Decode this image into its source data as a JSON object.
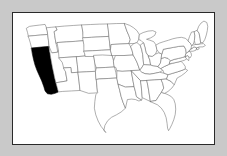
{
  "figure": {
    "background_color": "#c9c9c9",
    "map_background_color": "#ffffff",
    "frame_color": "#2a2a2a",
    "state_border_color": "#6d6d6d",
    "highlight_color": "#000000",
    "projection_note": "continental US, state boundaries"
  },
  "map_data": {
    "type": "choropleth",
    "region": "United States (lower 48)",
    "highlighted_states": [
      "California"
    ],
    "legend": [],
    "labels": [],
    "states": [
      {
        "name": "Washington",
        "highlighted": false,
        "path": "M17.5,9.5 L21.0,9.0 L27.5,8.2 L33.5,7.5 L35.0,11.0 L35.8,14.5 L36.2,18.0 L29.0,18.6 L22.0,19.2 L16.0,19.8 L15.2,16.0 L14.0,12.0 Z"
      },
      {
        "name": "Oregon",
        "highlighted": false,
        "path": "M16.0,19.8 L22.0,19.2 L29.0,18.6 L36.2,18.0 L37.0,24.0 L37.6,30.5 L30.0,31.2 L23.0,31.8 L19.4,32.2 L18.0,26.5 L16.8,22.5 Z"
      },
      {
        "name": "California",
        "highlighted": true,
        "path": "M19.4,32.2 L23.0,31.8 L30.0,31.2 L37.6,30.5 L38.4,36.0 L39.2,41.5 L40.2,47.0 L41.2,52.5 L42.4,58.0 L43.4,63.0 L44.8,68.5 L46.2,73.5 L47.4,78.0 L44.0,79.5 L40.0,80.5 L36.0,80.0 L33.5,77.0 L32.0,72.0 L30.0,66.5 L27.5,61.0 L25.0,55.5 L23.0,50.0 L21.5,44.5 L20.2,38.5 Z"
      },
      {
        "name": "Idaho",
        "highlighted": false,
        "path": "M35.0,11.0 L40.0,10.5 L45.0,10.0 L45.8,13.5 L43.0,15.0 L43.6,19.0 L44.2,23.0 L45.0,27.5 L46.0,32.0 L46.8,36.5 L41.0,37.2 L38.4,36.0 L37.6,30.5 L37.0,24.0 L36.2,18.0 L35.8,14.5 Z"
      },
      {
        "name": "Nevada",
        "highlighted": false,
        "path": "M37.6,30.5 L38.4,36.0 L39.2,41.5 L40.2,47.0 L41.2,52.5 L42.4,58.0 L43.4,63.0 L44.8,68.5 L56.5,66.5 L55.0,57.5 L53.5,48.0 L52.0,38.5 L50.5,29.5 L46.8,36.5 L41.0,37.2 Z"
      },
      {
        "name": "Montana",
        "highlighted": false,
        "path": "M45.0,10.0 L54.0,9.2 L63.0,8.6 L72.0,8.0 L73.0,16.0 L74.0,24.5 L65.0,25.2 L56.0,25.8 L46.4,26.4 L45.0,27.5 L44.2,23.0 L43.6,19.0 L43.0,15.0 L45.8,13.5 Z"
      },
      {
        "name": "Wyoming",
        "highlighted": false,
        "path": "M46.4,26.4 L56.0,25.8 L65.0,25.2 L74.0,24.5 L74.8,32.5 L75.5,40.5 L66.5,41.2 L57.5,41.8 L48.0,42.4 L47.4,34.5 Z"
      },
      {
        "name": "Utah",
        "highlighted": false,
        "path": "M48.0,42.4 L57.5,41.8 L66.5,41.2 L67.2,49.5 L68.0,57.5 L61.0,58.0 L60.4,52.5 L53.0,53.0 L51.5,47.5 Z"
      },
      {
        "name": "Colorado",
        "highlighted": false,
        "path": "M66.5,41.2 L75.5,40.5 L84.5,39.8 L85.5,48.0 L86.2,56.5 L77.0,57.0 L68.0,57.5 L67.2,49.5 Z"
      },
      {
        "name": "Arizona",
        "highlighted": false,
        "path": "M53.0,53.0 L60.4,52.5 L61.0,58.0 L68.0,57.5 L69.0,67.0 L70.0,76.5 L61.0,77.0 L52.0,77.5 L47.4,78.0 L46.2,73.5 L44.8,68.5 L56.5,66.5 L55.0,57.5 Z"
      },
      {
        "name": "New Mexico",
        "highlighted": false,
        "path": "M68.0,57.5 L77.0,57.0 L86.2,56.5 L87.0,65.0 L87.8,73.5 L88.2,79.0 L79.0,79.5 L70.0,76.5 L69.0,67.0 Z"
      },
      {
        "name": "North Dakota",
        "highlighted": false,
        "path": "M72.0,8.0 L81.0,7.6 L90.0,7.2 L99.0,7.0 L99.6,13.5 L100.2,20.0 L91.0,20.5 L82.0,21.0 L73.0,21.5 L73.0,16.0 Z"
      },
      {
        "name": "South Dakota",
        "highlighted": false,
        "path": "M73.0,21.5 L82.0,21.0 L91.0,20.5 L100.2,20.0 L101.0,27.0 L101.8,34.0 L92.5,34.5 L83.0,35.0 L74.0,35.5 L74.0,29.0 Z"
      },
      {
        "name": "Nebraska",
        "highlighted": false,
        "path": "M74.0,35.5 L83.0,35.0 L92.5,34.5 L101.8,34.0 L103.5,40.0 L105.0,45.5 L95.5,46.0 L86.0,46.5 L84.8,41.0 L75.5,41.0 L74.8,38.0 Z"
      },
      {
        "name": "Kansas",
        "highlighted": false,
        "path": "M84.5,39.8 L93.5,39.4 L103.5,40.0 L105.0,45.5 L106.0,52.0 L96.5,52.5 L87.0,53.0 L85.5,48.0 Z"
      },
      {
        "name": "Oklahoma",
        "highlighted": false,
        "path": "M86.2,56.5 L87.0,53.0 L96.5,52.5 L106.0,52.0 L107.5,58.0 L108.5,63.5 L99.5,64.0 L90.0,64.5 L87.0,65.0 Z"
      },
      {
        "name": "Texas",
        "highlighted": false,
        "path": "M87.8,73.5 L87.0,65.0 L90.0,64.5 L99.5,64.0 L108.5,63.5 L110.0,70.0 L111.5,76.5 L113.0,83.0 L115.0,89.0 L117.5,95.0 L113.0,99.0 L108.0,102.0 L103.0,104.5 L99.0,108.0 L96.0,113.0 L95.0,118.0 L97.0,120.5 L95.5,118.5 L92.0,114.0 L89.0,108.5 L86.5,102.0 L85.0,95.0 L85.5,88.0 L86.5,81.0 L88.2,79.0 Z"
      },
      {
        "name": "Minnesota",
        "highlighted": false,
        "path": "M99.0,7.0 L108.0,6.6 L116.5,6.5 L117.5,10.0 L119.0,14.5 L121.0,19.0 L122.5,23.5 L121.0,27.5 L112.0,28.0 L102.5,28.5 L101.8,34.0 L101.0,27.0 L100.2,20.0 L99.6,13.5 Z"
      },
      {
        "name": "Iowa",
        "highlighted": false,
        "path": "M101.8,34.0 L102.5,28.5 L112.0,28.0 L121.0,27.5 L123.0,31.0 L124.5,35.0 L125.5,39.5 L116.0,40.0 L107.0,40.0 L103.5,40.0 Z"
      },
      {
        "name": "Missouri",
        "highlighted": false,
        "path": "M105.0,45.5 L107.0,40.0 L116.0,40.0 L125.5,39.5 L127.5,43.0 L129.5,47.0 L131.0,51.0 L132.5,55.5 L123.5,56.0 L114.0,56.5 L108.5,56.0 L107.5,52.5 L106.0,52.0 Z"
      },
      {
        "name": "Arkansas",
        "highlighted": false,
        "path": "M108.5,63.5 L108.5,56.0 L114.0,56.5 L123.5,56.0 L124.5,61.5 L125.5,67.0 L126.5,72.5 L117.5,73.0 L110.0,70.0 Z"
      },
      {
        "name": "Louisiana",
        "highlighted": false,
        "path": "M110.0,70.0 L117.5,73.0 L126.5,72.5 L128.0,78.0 L129.0,83.0 L132.0,85.0 L134.5,86.5 L131.5,87.5 L128.0,86.0 L124.0,85.5 L119.5,86.0 L117.5,95.0 L115.0,89.0 L113.0,83.0 L111.5,76.5 Z"
      },
      {
        "name": "Wisconsin",
        "highlighted": false,
        "path": "M116.5,6.5 L122.0,8.5 L126.0,11.0 L129.5,14.0 L132.0,18.0 L131.5,23.0 L129.5,26.5 L126.5,27.5 L121.0,27.5 L122.5,23.5 L121.0,19.0 L119.0,14.5 L117.5,10.0 Z"
      },
      {
        "name": "Illinois",
        "highlighted": false,
        "path": "M126.5,27.5 L129.5,26.5 L133.0,29.5 L134.5,34.0 L135.5,39.0 L136.0,44.0 L136.5,49.5 L134.0,53.5 L132.5,55.5 L131.0,51.0 L129.5,47.0 L127.5,43.0 L125.5,39.5 L124.5,35.0 L123.0,31.0 Z"
      },
      {
        "name": "Michigan",
        "highlighted": false,
        "path": "M131.5,23.0 L132.0,18.0 L136.0,16.0 L141.0,14.5 L146.0,14.0 L149.5,15.5 L148.0,19.0 L144.0,21.5 L139.5,23.0 L143.0,24.0 L147.0,25.5 L149.5,29.0 L150.5,34.0 L149.0,38.5 L145.5,41.0 L141.5,40.5 L139.0,37.0 L138.0,32.0 L136.5,27.0 L134.0,24.5 Z"
      },
      {
        "name": "Indiana",
        "highlighted": false,
        "path": "M136.5,27.0 L138.0,32.0 L139.0,37.0 L141.5,40.5 L143.0,45.0 L143.8,50.0 L136.5,49.5 L136.0,44.0 L135.5,39.0 L134.5,34.0 L133.0,29.5 Z"
      },
      {
        "name": "Ohio",
        "highlighted": false,
        "path": "M141.5,40.5 L145.5,41.0 L149.0,38.5 L152.5,37.0 L155.5,38.5 L155.0,43.0 L154.0,48.0 L151.5,51.5 L147.0,51.0 L143.8,50.0 L143.0,45.0 Z"
      },
      {
        "name": "Kentucky",
        "highlighted": false,
        "path": "M134.0,53.5 L136.5,49.5 L143.8,50.0 L147.0,51.0 L151.5,51.5 L154.5,53.5 L156.5,55.5 L153.0,57.5 L148.5,58.5 L143.0,59.5 L138.0,59.0 L134.5,57.5 L132.5,55.5 Z"
      },
      {
        "name": "Tennessee",
        "highlighted": false,
        "path": "M132.5,55.5 L134.5,57.5 L138.0,59.0 L143.0,59.5 L148.5,58.5 L153.0,57.5 L158.0,58.5 L162.0,60.0 L160.5,64.5 L155.0,65.0 L148.0,65.5 L140.0,66.0 L133.5,66.5 L123.5,56.0 Z"
      },
      {
        "name": "Mississippi",
        "highlighted": false,
        "path": "M126.5,72.5 L125.5,67.0 L124.5,61.5 L123.5,56.0 L133.5,66.5 L134.0,72.0 L134.5,78.0 L135.0,84.0 L134.5,86.5 L132.0,85.0 L129.0,83.0 L128.0,78.0 Z"
      },
      {
        "name": "Alabama",
        "highlighted": false,
        "path": "M133.5,66.5 L140.0,66.0 L141.0,72.0 L142.0,78.0 L143.0,84.5 L143.5,88.0 L135.0,84.0 L134.5,78.0 L134.0,72.0 Z"
      },
      {
        "name": "Georgia",
        "highlighted": false,
        "path": "M140.0,66.0 L148.0,65.5 L155.0,65.0 L156.5,69.5 L157.5,74.0 L155.0,78.5 L152.0,83.0 L149.5,87.0 L143.5,88.0 L143.0,84.5 L142.0,78.0 L141.0,72.0 Z"
      },
      {
        "name": "Florida",
        "highlighted": false,
        "path": "M143.5,88.0 L149.5,87.0 L152.0,83.0 L155.0,78.5 L158.5,79.5 L162.0,81.0 L165.5,83.0 L168.0,86.0 L169.5,90.5 L170.0,96.0 L169.5,101.5 L168.0,107.0 L166.0,112.0 L164.0,116.0 L162.5,118.5 L161.5,116.0 L161.0,111.0 L160.0,105.0 L158.0,99.5 L155.0,95.0 L151.0,91.5 L146.5,89.5 Z"
      },
      {
        "name": "South Carolina",
        "highlighted": false,
        "path": "M155.0,65.0 L160.5,64.5 L165.0,67.0 L168.5,70.5 L166.0,74.0 L162.0,77.5 L158.5,79.5 L155.0,78.5 L157.5,74.0 L156.5,69.5 Z"
      },
      {
        "name": "North Carolina",
        "highlighted": false,
        "path": "M160.5,64.5 L162.0,60.0 L167.0,58.5 L172.0,57.0 L176.5,55.5 L180.0,54.0 L182.5,55.5 L180.0,58.0 L176.0,61.0 L171.5,63.5 L168.5,70.5 L165.0,67.0 Z"
      },
      {
        "name": "Virginia",
        "highlighted": false,
        "path": "M156.5,55.5 L154.5,53.5 L158.0,51.5 L162.5,49.5 L167.0,48.0 L171.5,47.0 L175.5,46.0 L178.0,48.5 L180.0,51.5 L180.0,54.0 L176.5,55.5 L172.0,57.0 L167.0,58.5 L162.0,60.0 L158.0,58.5 Z"
      },
      {
        "name": "West Virginia",
        "highlighted": false,
        "path": "M151.5,51.5 L154.0,48.0 L155.0,43.0 L158.5,42.0 L162.0,43.0 L164.5,45.5 L163.5,48.5 L162.5,49.5 L158.0,51.5 L154.5,53.5 Z"
      },
      {
        "name": "Maryland",
        "highlighted": false,
        "path": "M164.5,45.5 L168.5,44.0 L173.0,43.0 L177.0,42.0 L180.0,41.0 L181.5,43.5 L179.0,45.0 L175.5,46.0 L171.5,47.0 L167.0,48.0 L163.5,48.5 Z"
      },
      {
        "name": "Delaware",
        "highlighted": false,
        "path": "M180.0,41.0 L182.5,40.0 L184.0,42.5 L183.5,45.5 L181.5,43.5 Z"
      },
      {
        "name": "Pennsylvania",
        "highlighted": false,
        "path": "M155.5,38.5 L157.0,33.5 L162.0,32.5 L167.5,31.5 L173.0,30.5 L178.5,30.0 L180.5,33.5 L181.0,37.5 L180.0,41.0 L177.0,42.0 L173.0,43.0 L168.5,44.0 L164.5,45.5 L162.0,43.0 L158.5,42.0 L155.0,43.0 Z"
      },
      {
        "name": "New Jersey",
        "highlighted": false,
        "path": "M181.0,37.5 L184.0,35.5 L186.0,37.0 L186.5,40.0 L185.0,42.5 L182.5,40.0 L180.0,41.0 Z"
      },
      {
        "name": "New York",
        "highlighted": false,
        "path": "M149.5,29.0 L153.0,27.0 L157.5,25.5 L162.5,24.0 L167.0,22.5 L171.5,21.5 L176.0,21.0 L180.0,22.0 L183.0,24.5 L185.5,27.5 L188.0,30.5 L186.0,33.0 L184.0,35.5 L181.0,37.5 L180.5,33.5 L178.5,30.0 L173.0,30.5 L167.5,31.5 L162.0,32.5 L157.0,33.5 L155.5,38.5 L152.5,37.0 L150.5,34.0 Z"
      },
      {
        "name": "Connecticut",
        "highlighted": false,
        "path": "M186.0,33.0 L189.5,31.0 L192.0,32.0 L191.0,34.5 L188.0,35.5 L184.0,35.5 Z"
      },
      {
        "name": "Rhode Island",
        "highlighted": false,
        "path": "M192.0,32.0 L194.0,31.0 L194.5,33.0 L192.5,34.0 Z"
      },
      {
        "name": "Massachusetts",
        "highlighted": false,
        "path": "M186.0,33.0 L186.5,29.5 L190.5,28.5 L195.0,28.0 L199.0,27.5 L201.0,29.5 L198.5,31.0 L194.5,31.0 L192.0,32.0 L189.5,31.0 Z"
      },
      {
        "name": "Vermont",
        "highlighted": false,
        "path": "M183.0,24.5 L184.5,20.0 L186.5,15.5 L189.5,15.0 L190.0,19.5 L189.5,24.5 L188.5,28.0 L186.5,29.5 L185.5,27.5 Z"
      },
      {
        "name": "New Hampshire",
        "highlighted": false,
        "path": "M189.5,15.0 L192.5,13.5 L194.5,17.0 L195.5,22.0 L196.0,26.5 L195.0,28.0 L190.5,28.5 L189.5,24.5 L190.0,19.5 Z"
      },
      {
        "name": "Maine",
        "highlighted": false,
        "path": "M192.5,13.5 L194.0,9.5 L196.5,6.0 L199.5,4.0 L202.5,5.5 L203.5,9.5 L203.0,14.0 L202.0,18.5 L200.5,23.0 L198.5,26.5 L196.0,26.5 L195.5,22.0 L194.5,17.0 Z"
      }
    ]
  }
}
